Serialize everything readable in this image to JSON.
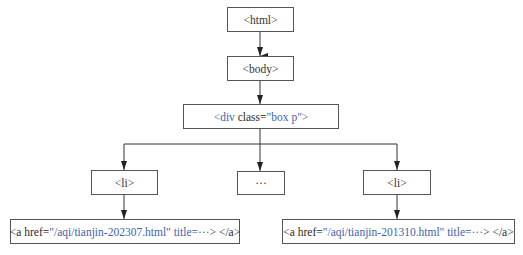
{
  "diagram": {
    "type": "tree",
    "nodes": {
      "html": {
        "label": "<html>"
      },
      "body": {
        "label": "<body>"
      },
      "div": {
        "tag_open": "<div",
        "attr_name": " class=",
        "attr_value": "\"box p\"",
        "tag_close": ">"
      },
      "li_left": {
        "label": "<li>"
      },
      "ellipsis": {
        "label": "···"
      },
      "li_right": {
        "label": "<li>"
      },
      "a_left": {
        "open": "<a href=",
        "href": "\"/aqi/tianjin-202307.html\"",
        "title": " title=···",
        "close_gt": ">",
        "end_tag": " </a>"
      },
      "a_right": {
        "open": "<a href=",
        "href": "\"/aqi/tianjin-201310.html\"",
        "title": " title=···",
        "close_gt": ">",
        "end_tag": " </a>"
      }
    },
    "edges": [
      [
        "html",
        "body"
      ],
      [
        "body",
        "div"
      ],
      [
        "div",
        "li_left"
      ],
      [
        "div",
        "ellipsis"
      ],
      [
        "div",
        "li_right"
      ],
      [
        "li_left",
        "a_left"
      ],
      [
        "li_right",
        "a_right"
      ]
    ],
    "colors": {
      "highlight": "#3d63ad",
      "text": "#333333",
      "border": "#555555"
    }
  }
}
